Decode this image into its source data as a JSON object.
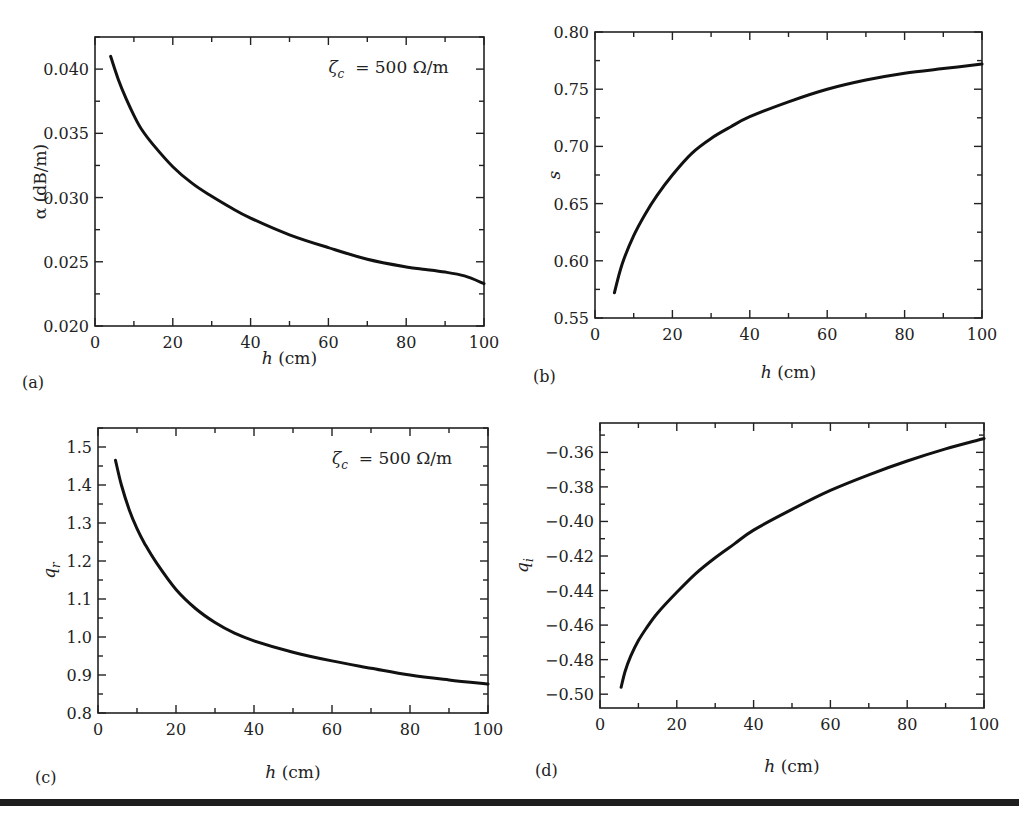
{
  "figure": {
    "annotation_symbol": "ζ",
    "annotation_sub": "c",
    "annotation_text": " = 500 Ω/m"
  },
  "chart_data": [
    {
      "id": "a",
      "type": "line",
      "panel_label": "(a)",
      "title": "",
      "xlabel_italic": "h",
      "xlabel_rest": " (cm)",
      "ylabel": "α (dB/m)",
      "xlim": [
        0,
        100
      ],
      "ylim": [
        0.02,
        0.0425
      ],
      "xticks": [
        0,
        20,
        40,
        60,
        80,
        100
      ],
      "xtick_labels": [
        "0",
        "20",
        "40",
        "60",
        "80",
        "100"
      ],
      "yticks": [
        0.02,
        0.025,
        0.03,
        0.035,
        0.04
      ],
      "ytick_labels": [
        "0.020",
        "0.025",
        "0.030",
        "0.035",
        "0.040"
      ],
      "annotation": "ζc = 500 Ω/m",
      "grid": false,
      "series": [
        {
          "name": "alpha",
          "x": [
            4,
            6,
            8,
            10,
            12,
            15,
            20,
            25,
            30,
            35,
            40,
            50,
            60,
            70,
            80,
            85,
            90,
            95,
            100
          ],
          "y": [
            0.041,
            0.0392,
            0.0377,
            0.0364,
            0.0353,
            0.0341,
            0.0324,
            0.0311,
            0.0301,
            0.0292,
            0.0284,
            0.0271,
            0.0261,
            0.0252,
            0.0246,
            0.0244,
            0.0242,
            0.0239,
            0.0233
          ]
        }
      ]
    },
    {
      "id": "b",
      "type": "line",
      "panel_label": "(b)",
      "title": "",
      "xlabel_italic": "h",
      "xlabel_rest": " (cm)",
      "ylabel": "s",
      "xlim": [
        0,
        100
      ],
      "ylim": [
        0.55,
        0.8
      ],
      "xticks": [
        0,
        20,
        40,
        60,
        80,
        100
      ],
      "xtick_labels": [
        "0",
        "20",
        "40",
        "60",
        "80",
        "100"
      ],
      "yticks": [
        0.55,
        0.6,
        0.65,
        0.7,
        0.75,
        0.8
      ],
      "ytick_labels": [
        "0.55",
        "0.60",
        "0.65",
        "0.70",
        "0.75",
        "0.80"
      ],
      "grid": false,
      "series": [
        {
          "name": "s",
          "x": [
            5,
            7,
            10,
            13,
            16,
            20,
            25,
            30,
            35,
            40,
            50,
            60,
            70,
            80,
            90,
            100
          ],
          "y": [
            0.572,
            0.597,
            0.622,
            0.641,
            0.657,
            0.675,
            0.694,
            0.707,
            0.717,
            0.726,
            0.739,
            0.75,
            0.758,
            0.764,
            0.768,
            0.772
          ]
        }
      ]
    },
    {
      "id": "c",
      "type": "line",
      "panel_label": "(c)",
      "title": "",
      "xlabel_italic": "h",
      "xlabel_rest": " (cm)",
      "ylabel": "q_r",
      "xlim": [
        0,
        100
      ],
      "ylim": [
        0.8,
        1.55
      ],
      "xticks": [
        0,
        20,
        40,
        60,
        80,
        100
      ],
      "xtick_labels": [
        "0",
        "20",
        "40",
        "60",
        "80",
        "100"
      ],
      "yticks": [
        0.8,
        0.9,
        1.0,
        1.1,
        1.2,
        1.3,
        1.4,
        1.5
      ],
      "ytick_labels": [
        "0.8",
        "0.9",
        "1.0",
        "1.1",
        "1.2",
        "1.3",
        "1.4",
        "1.5"
      ],
      "annotation": "ζc = 500 Ω/m",
      "grid": false,
      "series": [
        {
          "name": "q_r",
          "x": [
            4.5,
            6,
            8,
            10,
            12,
            15,
            20,
            25,
            30,
            35,
            40,
            50,
            60,
            70,
            80,
            90,
            100
          ],
          "y": [
            1.465,
            1.4,
            1.335,
            1.285,
            1.245,
            1.195,
            1.125,
            1.075,
            1.038,
            1.01,
            0.99,
            0.96,
            0.937,
            0.918,
            0.9,
            0.887,
            0.876
          ]
        }
      ]
    },
    {
      "id": "d",
      "type": "line",
      "panel_label": "(d)",
      "title": "",
      "xlabel_italic": "h",
      "xlabel_rest": " (cm)",
      "ylabel": "q_i",
      "xlim": [
        0,
        100
      ],
      "ylim": [
        -0.508,
        -0.343
      ],
      "xticks": [
        0,
        20,
        40,
        60,
        80,
        100
      ],
      "xtick_labels": [
        "0",
        "20",
        "40",
        "60",
        "80",
        "100"
      ],
      "yticks": [
        -0.5,
        -0.48,
        -0.46,
        -0.44,
        -0.42,
        -0.4,
        -0.38,
        -0.36
      ],
      "ytick_labels": [
        "−0.50",
        "−0.48",
        "−0.46",
        "−0.44",
        "−0.42",
        "−0.40",
        "−0.38",
        "−0.36"
      ],
      "grid": false,
      "series": [
        {
          "name": "q_i",
          "x": [
            5.5,
            6.5,
            8,
            10,
            12,
            15,
            20,
            25,
            30,
            35,
            40,
            50,
            60,
            70,
            80,
            90,
            100
          ],
          "y": [
            -0.496,
            -0.487,
            -0.478,
            -0.469,
            -0.462,
            -0.453,
            -0.441,
            -0.43,
            -0.421,
            -0.413,
            -0.405,
            -0.393,
            -0.382,
            -0.373,
            -0.365,
            -0.358,
            -0.352
          ]
        }
      ]
    }
  ]
}
